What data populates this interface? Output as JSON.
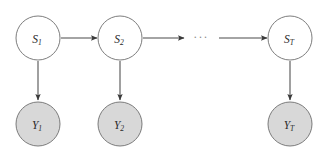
{
  "diagram": {
    "type": "hidden-markov-model-graph",
    "canvas": {
      "width": 316,
      "height": 155,
      "background": "#ffffff"
    },
    "colors": {
      "state_fill": "#ffffff",
      "observed_fill": "#d8d8d8",
      "node_stroke": "#6e6e6e",
      "edge_stroke": "#4a4a4a",
      "arrow_fill": "#3a3a3a",
      "label_color": "#2a2a2a",
      "ellipsis_color": "#8a8a8a"
    },
    "geometry": {
      "state_row_cy": 38,
      "observed_row_cy": 124,
      "node_radius": 22,
      "columns_x": [
        38,
        120,
        290
      ]
    },
    "state_nodes": [
      {
        "id": "S1",
        "base": "S",
        "subscript": "1",
        "cx": 38,
        "cy": 38,
        "r": 22,
        "shaded": false
      },
      {
        "id": "S2",
        "base": "S",
        "subscript": "2",
        "cx": 120,
        "cy": 38,
        "r": 22,
        "shaded": false
      },
      {
        "id": "ST",
        "base": "S",
        "subscript": "T",
        "cx": 290,
        "cy": 38,
        "r": 22,
        "shaded": false
      }
    ],
    "observed_nodes": [
      {
        "id": "Y1",
        "base": "Y",
        "subscript": "1",
        "cx": 38,
        "cy": 124,
        "r": 22,
        "shaded": true
      },
      {
        "id": "Y2",
        "base": "Y",
        "subscript": "2",
        "cx": 120,
        "cy": 124,
        "r": 22,
        "shaded": true
      },
      {
        "id": "YT",
        "base": "Y",
        "subscript": "T",
        "cx": 290,
        "cy": 124,
        "r": 22,
        "shaded": true
      }
    ],
    "transition_edges": [
      {
        "id": "S1-to-S2",
        "from": "S1",
        "to": "S2",
        "x1": 61,
        "x2": 97,
        "y": 38,
        "arrowhead": true
      },
      {
        "id": "S2-to-dots",
        "from": "S2",
        "to": "ellipsis",
        "x1": 143,
        "x2": 184,
        "y": 38,
        "arrowhead": true
      },
      {
        "id": "dots-to-ST",
        "from": "ellipsis",
        "to": "ST",
        "x1": 219,
        "x2": 267,
        "y": 38,
        "arrowhead": true
      }
    ],
    "emission_edges": [
      {
        "id": "S1-to-Y1",
        "from": "S1",
        "to": "Y1",
        "x": 38,
        "y1": 61,
        "y2": 100,
        "arrowhead": true
      },
      {
        "id": "S2-to-Y2",
        "from": "S2",
        "to": "Y2",
        "x": 120,
        "y1": 61,
        "y2": 100,
        "arrowhead": true
      },
      {
        "id": "ST-to-YT",
        "from": "ST",
        "to": "YT",
        "x": 290,
        "y1": 61,
        "y2": 100,
        "arrowhead": true
      }
    ],
    "ellipsis": {
      "id": "sequence-ellipsis",
      "text": "···",
      "cx": 201,
      "cy": 38
    }
  }
}
